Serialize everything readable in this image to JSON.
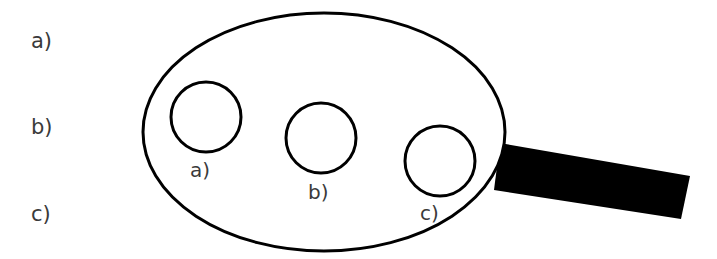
{
  "figure": {
    "title": "",
    "background_color": "#ffffff",
    "stroke_color": "#000000",
    "fill_color": "#000000",
    "text_color": "#3a3a3a"
  },
  "legend": {
    "items": [
      {
        "label": "a)"
      },
      {
        "label": "b)"
      },
      {
        "label": "c)"
      }
    ]
  },
  "diagram": {
    "outer_shape": {
      "kind": "ellipse",
      "cx": 324,
      "cy": 132,
      "rx": 181,
      "ry": 119,
      "stroke_width": 3
    },
    "handle": {
      "kind": "quadrilateral",
      "points": "500,143 690,176 681,219 494,190",
      "fill": "#000000"
    },
    "circles": [
      {
        "label": "a)",
        "cx": 206,
        "cy": 117,
        "rx": 35,
        "ry": 35,
        "stroke_width": 3
      },
      {
        "label": "b)",
        "cx": 321,
        "cy": 138,
        "rx": 35,
        "ry": 35,
        "stroke_width": 3
      },
      {
        "label": "c)",
        "cx": 440,
        "cy": 161,
        "rx": 35,
        "ry": 35,
        "stroke_width": 3
      }
    ]
  }
}
